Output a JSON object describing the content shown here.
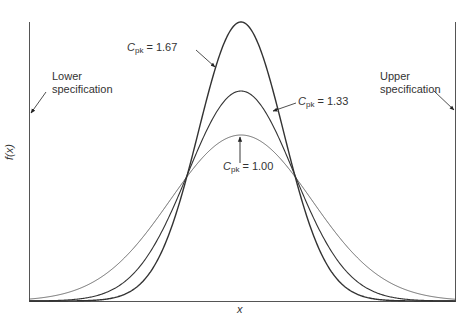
{
  "chart_data": {
    "type": "line",
    "title": "",
    "xlabel": "x",
    "ylabel": "f(x)",
    "grid": false,
    "legend": "none (inline annotations)",
    "spec_limits": {
      "lower": {
        "label": "Lower specification",
        "x": -3
      },
      "upper": {
        "label": "Upper specification",
        "x": 3
      }
    },
    "xlim": [
      -3,
      3
    ],
    "series": [
      {
        "name": "Cpk = 1.67",
        "sigma": 0.6,
        "mean": 0,
        "line": "solid, thick"
      },
      {
        "name": "Cpk = 1.33",
        "sigma": 0.75,
        "mean": 0,
        "line": "solid, medium"
      },
      {
        "name": "Cpk = 1.00",
        "sigma": 1.0,
        "mean": 0,
        "line": "solid, thin"
      }
    ],
    "annotations": [
      {
        "text": "Cpk = 1.67",
        "points_to": "left flank of tallest curve"
      },
      {
        "text": "Cpk = 1.33",
        "points_to": "right flank of middle curve"
      },
      {
        "text": "Cpk = 1.00",
        "points_to": "peak of widest curve"
      },
      {
        "text": "Lower specification",
        "points_to": "left vertical line"
      },
      {
        "text": "Upper specification",
        "points_to": "right vertical line"
      }
    ]
  },
  "labels": {
    "lower_spec_line1": "Lower",
    "lower_spec_line2": "specification",
    "upper_spec_line1": "Upper",
    "upper_spec_line2": "specification",
    "c_letter": "C",
    "pk_sub": "pk",
    "cpk167_val": " = 1.67",
    "cpk133_val": " = 1.33",
    "cpk100_val": " = 1.00",
    "xlabel": "x",
    "ylabel": "f(x)"
  }
}
